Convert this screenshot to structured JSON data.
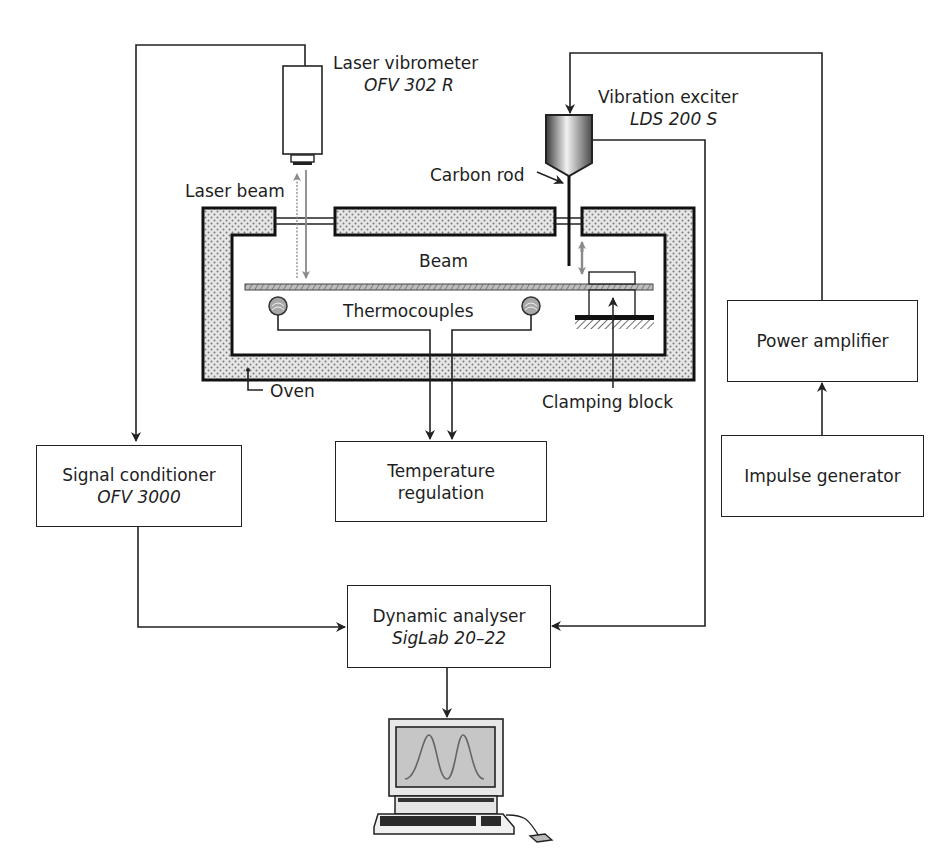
{
  "diagram": {
    "type": "experimental-setup",
    "components": {
      "laser_vibrometer": {
        "label": "Laser vibrometer",
        "model": "OFV 302 R"
      },
      "vibration_exciter": {
        "label": "Vibration exciter",
        "model": "LDS 200 S"
      },
      "carbon_rod": {
        "label": "Carbon rod"
      },
      "laser_beam": {
        "label": "Laser beam"
      },
      "beam": {
        "label": "Beam"
      },
      "thermocouples": {
        "label": "Thermocouples"
      },
      "oven": {
        "label": "Oven"
      },
      "clamping_block": {
        "label": "Clamping block"
      },
      "signal_conditioner": {
        "label": "Signal conditioner",
        "model": "OFV 3000"
      },
      "temperature_regulation": {
        "line1": "Temperature",
        "line2": "regulation"
      },
      "power_amplifier": {
        "label": "Power amplifier"
      },
      "impulse_generator": {
        "label": "Impulse generator"
      },
      "dynamic_analyser": {
        "label": "Dynamic analyser",
        "model": "SigLab 20–22"
      },
      "computer": {
        "label": ""
      }
    },
    "connections": [
      {
        "from": "laser_vibrometer",
        "to": "signal_conditioner"
      },
      {
        "from": "signal_conditioner",
        "to": "dynamic_analyser"
      },
      {
        "from": "vibration_exciter",
        "to": "dynamic_analyser"
      },
      {
        "from": "impulse_generator",
        "to": "power_amplifier"
      },
      {
        "from": "power_amplifier",
        "to": "vibration_exciter"
      },
      {
        "from": "thermocouples",
        "to": "temperature_regulation"
      },
      {
        "from": "dynamic_analyser",
        "to": "computer"
      }
    ],
    "colors": {
      "line": "#222222",
      "insulation_fill": "#d8d8d8",
      "screen_fill": "#c8c8c8",
      "beam_arrow": "#8a8a8a"
    }
  }
}
